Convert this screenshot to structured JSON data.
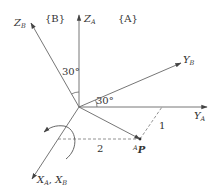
{
  "diagram": {
    "type": "coordinate-frame-rotation",
    "frames": {
      "frame_B_label": "{B}",
      "frame_A_label": "{A}"
    },
    "axes": {
      "z_b": {
        "main": "Z",
        "sub": "B"
      },
      "z_a": {
        "main": "Z",
        "sub": "A"
      },
      "y_b": {
        "main": "Y",
        "sub": "B"
      },
      "y_a": {
        "main": "Y",
        "sub": "A"
      },
      "x_ab": {
        "main1": "X",
        "sub1": "A",
        "sep": ", ",
        "main2": "X",
        "sub2": "B"
      }
    },
    "angles": {
      "z_angle": "30°",
      "y_angle": "30°"
    },
    "point": {
      "sup": "A",
      "main": "P"
    },
    "dimensions": {
      "along_y": "2",
      "along_x": "1"
    },
    "colors": {
      "line": "#555555",
      "text": "#333333"
    }
  }
}
